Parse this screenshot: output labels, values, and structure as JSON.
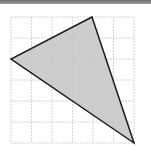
{
  "diagram": {
    "type": "triangle-on-grid",
    "grid": {
      "columns": 6,
      "rows": 6,
      "line_color": "#d4d4d4"
    },
    "triangle": {
      "vertices": [
        {
          "x": 92,
          "y": 17
        },
        {
          "x": 11,
          "y": 59
        },
        {
          "x": 134,
          "y": 143
        }
      ],
      "fill": "#c4c4c4",
      "stroke": "#1a1a1a"
    }
  }
}
